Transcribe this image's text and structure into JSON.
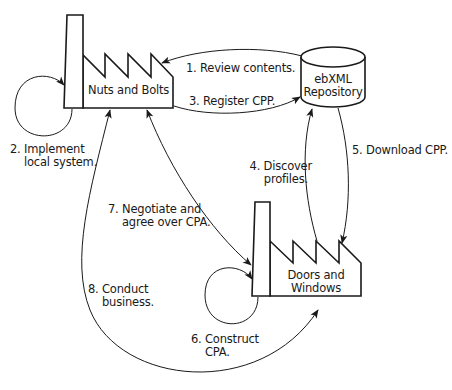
{
  "diagram": {
    "type": "ebXML business collaboration process",
    "nodes": [
      {
        "id": "nuts",
        "label": "Nuts and Bolts",
        "shape": "factory"
      },
      {
        "id": "repo",
        "label_line1": "ebXML",
        "label_line2": "Repository",
        "shape": "cylinder"
      },
      {
        "id": "doors",
        "label_line1": "Doors and",
        "label_line2": "Windows",
        "shape": "factory"
      }
    ],
    "steps": [
      {
        "line1": "1. Review contents.",
        "line2": "",
        "from": "repo",
        "to": "nuts"
      },
      {
        "line1": "2. Implement",
        "line2": "local system.",
        "from": "nuts",
        "to": "nuts"
      },
      {
        "line1": "3. Register CPP.",
        "line2": "",
        "from": "nuts",
        "to": "repo"
      },
      {
        "line1": "4. Discover",
        "line2": "profiles.",
        "from": "doors",
        "to": "repo"
      },
      {
        "line1": "5. Download CPP.",
        "line2": "",
        "from": "repo",
        "to": "doors"
      },
      {
        "line1": "6. Construct",
        "line2": "CPA.",
        "from": "doors",
        "to": "doors"
      },
      {
        "line1": "7. Negotiate and",
        "line2": "agree over CPA.",
        "from": "nuts",
        "to": "doors",
        "bidirectional": true
      },
      {
        "line1": "8. Conduct",
        "line2": "business.",
        "from": "nuts",
        "to": "doors",
        "bidirectional": true
      }
    ],
    "colors": {
      "stroke": "#1a1a1a",
      "background": "#ffffff",
      "text": "#1a1a1a"
    }
  }
}
